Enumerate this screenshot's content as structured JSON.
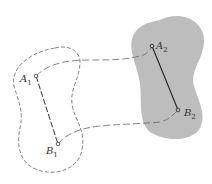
{
  "diagram": {
    "title": "",
    "colors": {
      "background": "#ffffff",
      "region_fill": "#bdbdbd",
      "stroke": "#555555",
      "segment": "#333333"
    },
    "region1": {
      "style": "dashed-outline",
      "fill": "none"
    },
    "region2": {
      "style": "filled",
      "fill": "#bdbdbd"
    },
    "points": {
      "A1": {
        "letter": "A",
        "sub": "1"
      },
      "B1": {
        "letter": "B",
        "sub": "1"
      },
      "A2": {
        "letter": "A",
        "sub": "2"
      },
      "B2": {
        "letter": "B",
        "sub": "2"
      }
    },
    "connectors": [
      "A1-A2 dashed curve",
      "B1-B2 dashed curve"
    ]
  }
}
